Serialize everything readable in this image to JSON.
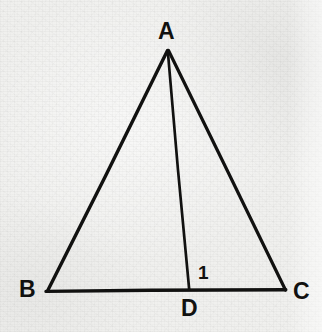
{
  "figure": {
    "kind": "geometry-diagram",
    "background_color": "#f0f0ee",
    "stroke_color": "#111110",
    "stroke_width": 3,
    "width": 322,
    "height": 332
  },
  "points": {
    "A": {
      "label": "A",
      "x": 167,
      "y": 50
    },
    "B": {
      "label": "B",
      "x": 47,
      "y": 291
    },
    "C": {
      "label": "C",
      "x": 285,
      "y": 290
    },
    "D": {
      "label": "D",
      "x": 189,
      "y": 289
    }
  },
  "segments": [
    {
      "name": "AB",
      "from": "A",
      "to": "B"
    },
    {
      "name": "BC",
      "from": "B",
      "to": "C"
    },
    {
      "name": "CA",
      "from": "C",
      "to": "A"
    },
    {
      "name": "AD",
      "from": "A",
      "to": "D"
    }
  ],
  "angle_marks": [
    {
      "name": "angle-1",
      "label": "1",
      "at_vertex": "D",
      "x": 204,
      "y": 272
    }
  ],
  "labels": {
    "A": "A",
    "B": "B",
    "C": "C",
    "D": "D",
    "angle_1": "1"
  }
}
